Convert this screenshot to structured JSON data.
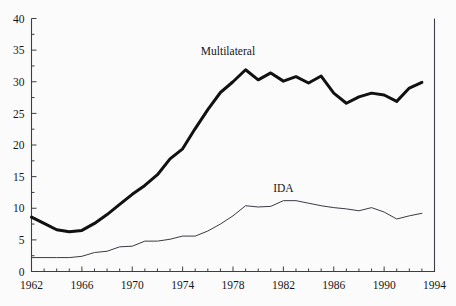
{
  "chart_data": {
    "type": "line",
    "title": "",
    "xlabel": "",
    "ylabel": "",
    "xlim": [
      1962,
      1994
    ],
    "ylim": [
      0,
      40
    ],
    "grid": false,
    "legend_position": "inline-annotation",
    "x_ticks": [
      1962,
      1966,
      1970,
      1974,
      1978,
      1982,
      1986,
      1990,
      1994
    ],
    "x_tick_labels": [
      "1962",
      "1966",
      "1970",
      "1974",
      "1978",
      "1982",
      "1986",
      "1990",
      "1994"
    ],
    "x_minor_tick_interval": 1,
    "y_ticks": [
      0,
      5,
      10,
      15,
      20,
      25,
      30,
      35,
      40
    ],
    "y_tick_labels": [
      "0",
      "5",
      "10",
      "15",
      "20",
      "25",
      "30",
      "35",
      "40"
    ],
    "y_minor_tick_interval": 2.5,
    "x": [
      1962,
      1963,
      1964,
      1965,
      1966,
      1967,
      1968,
      1969,
      1970,
      1971,
      1972,
      1973,
      1974,
      1975,
      1976,
      1977,
      1978,
      1979,
      1980,
      1981,
      1982,
      1983,
      1984,
      1985,
      1986,
      1987,
      1988,
      1989,
      1990,
      1991,
      1992,
      1993
    ],
    "series": [
      {
        "name": "Multilateral",
        "label": "Multilateral",
        "color": "#111111",
        "line_width": 3.0,
        "label_x": 1977.6,
        "label_y": 34.2,
        "values": [
          8.6,
          7.6,
          6.6,
          6.3,
          6.5,
          7.6,
          9.0,
          10.6,
          12.2,
          13.6,
          15.3,
          17.8,
          19.4,
          22.6,
          25.6,
          28.3,
          30.0,
          31.9,
          30.3,
          31.4,
          30.1,
          30.8,
          29.8,
          30.9,
          28.2,
          26.6,
          27.6,
          28.2,
          27.9,
          26.9,
          29.0,
          29.9
        ]
      },
      {
        "name": "IDA",
        "label": "IDA",
        "color": "#3a3a42",
        "line_width": 1.0,
        "label_x": 1982.0,
        "label_y": 12.6,
        "values": [
          2.2,
          2.2,
          2.2,
          2.2,
          2.4,
          3.0,
          3.2,
          3.9,
          4.0,
          4.8,
          4.8,
          5.1,
          5.6,
          5.6,
          6.4,
          7.5,
          8.8,
          10.4,
          10.2,
          10.3,
          11.2,
          11.2,
          10.8,
          10.4,
          10.1,
          9.9,
          9.6,
          10.1,
          9.4,
          8.3,
          8.8,
          9.2
        ]
      }
    ]
  },
  "figure": {
    "background_color": "#fbfbfb",
    "axis_color": "#3d3d46"
  }
}
